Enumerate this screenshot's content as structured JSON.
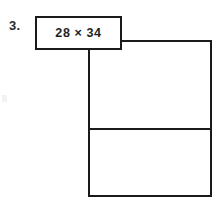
{
  "worksheet": {
    "problem_number": "3.",
    "expression": "28 × 34",
    "operands": [
      28,
      34
    ],
    "operator": "×",
    "colors": {
      "stroke": "#1a1a1a",
      "text": "#1f1f1f",
      "background": "#ffffff"
    },
    "area_model": {
      "cells": [
        {
          "label": "",
          "position": "top"
        },
        {
          "label": "",
          "position": "bottom"
        }
      ],
      "row_count": 2,
      "column_count": 1
    }
  }
}
